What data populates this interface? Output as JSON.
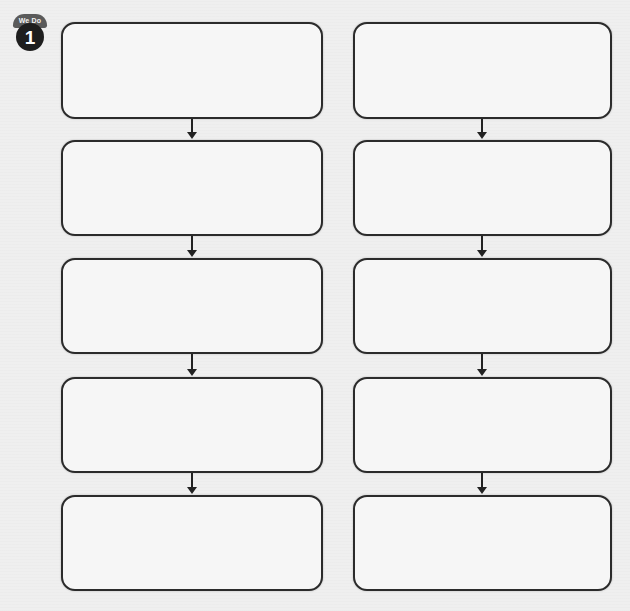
{
  "badge": {
    "label_top": "We Do",
    "number": "1"
  },
  "diagram": {
    "type": "flowchart-worksheet",
    "columns": [
      {
        "name": "left",
        "boxes": [
          "",
          "",
          "",
          "",
          ""
        ]
      },
      {
        "name": "right",
        "boxes": [
          "",
          "",
          "",
          "",
          ""
        ]
      }
    ],
    "connector": "down-arrow",
    "colors": {
      "stroke": "#2b2b2b",
      "box_fill": "#f6f6f6",
      "page": "#efefef",
      "badge_dark": "#1e1e1e",
      "badge_banner": "#5a5a5a"
    }
  }
}
